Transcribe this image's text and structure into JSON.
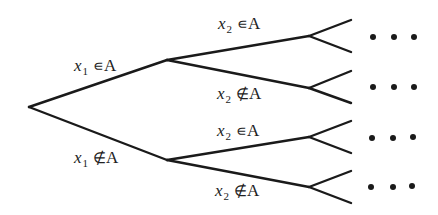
{
  "diagram": {
    "type": "binary decision tree",
    "root": {
      "x": 29,
      "y": 107
    },
    "level1": [
      {
        "id": "in",
        "x": 167,
        "y": 60,
        "label": {
          "var": "x",
          "sub": "1",
          "rel": "∊",
          "set": "A"
        }
      },
      {
        "id": "notin",
        "x": 167,
        "y": 160,
        "label": {
          "var": "x",
          "sub": "1",
          "rel": "∉",
          "set": "A"
        }
      }
    ],
    "level2": [
      {
        "parent": "in",
        "x": 309,
        "y": 36,
        "label": {
          "var": "x",
          "sub": "2",
          "rel": "∊",
          "set": "A"
        }
      },
      {
        "parent": "in",
        "x": 309,
        "y": 88,
        "label": {
          "var": "x",
          "sub": "2",
          "rel": "∉",
          "set": "A"
        }
      },
      {
        "parent": "notin",
        "x": 309,
        "y": 137,
        "label": {
          "var": "x",
          "sub": "2",
          "rel": "∊",
          "set": "A"
        }
      },
      {
        "parent": "notin",
        "x": 309,
        "y": 187,
        "label": {
          "var": "x",
          "sub": "2",
          "rel": "∉",
          "set": "A"
        }
      }
    ],
    "continuation": "…",
    "ellipsis_rows": 4
  }
}
